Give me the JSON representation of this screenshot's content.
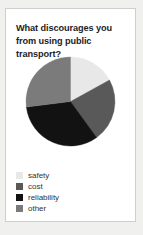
{
  "card": {
    "title": "What discourages you from using public transport?",
    "background": "#ffffff",
    "border_color": "#cfcfcf"
  },
  "page": {
    "background": "#f0f0ee"
  },
  "chart_data": {
    "type": "pie",
    "title": "What discourages you from using public transport?",
    "xlabel": "",
    "ylabel": "",
    "legend_position": "bottom-left",
    "start_angle_deg": 0,
    "direction": "clockwise",
    "categories": [
      "safety",
      "cost",
      "reliability",
      "other"
    ],
    "values": [
      17,
      23,
      33,
      27
    ],
    "value_unit": "percent",
    "colors": [
      "#e8e8e8",
      "#595959",
      "#121212",
      "#7b7b7b"
    ],
    "slices": [
      {
        "label": "safety",
        "value": 17,
        "color": "#e8e8e8",
        "start_deg": 0,
        "end_deg": 61.2
      },
      {
        "label": "cost",
        "value": 23,
        "color": "#595959",
        "start_deg": 61.2,
        "end_deg": 144.0
      },
      {
        "label": "reliability",
        "value": 33,
        "color": "#121212",
        "start_deg": 144.0,
        "end_deg": 262.8
      },
      {
        "label": "other",
        "value": 27,
        "color": "#7b7b7b",
        "start_deg": 262.8,
        "end_deg": 360.0
      }
    ]
  },
  "legend": {
    "items": [
      {
        "label": "safety",
        "color": "#e8e8e8"
      },
      {
        "label": "cost",
        "color": "#595959"
      },
      {
        "label": "reliability",
        "color": "#121212"
      },
      {
        "label": "other",
        "color": "#7b7b7b"
      }
    ]
  }
}
